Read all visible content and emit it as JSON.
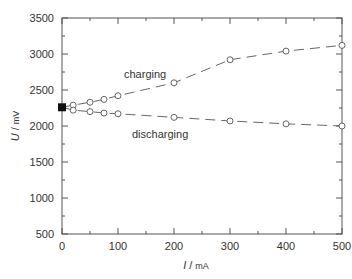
{
  "chart_data": {
    "type": "line",
    "title": "",
    "xlabel": "I / mA",
    "ylabel": "U / mV",
    "xlim": [
      0,
      500
    ],
    "ylim": [
      500,
      3500
    ],
    "xticks": [
      0,
      100,
      200,
      300,
      400,
      500
    ],
    "yticks": [
      500,
      1000,
      1500,
      2000,
      2500,
      3000,
      3500
    ],
    "grid": false,
    "legend": "inline annotations",
    "series": [
      {
        "name": "charging",
        "x": [
          0,
          20,
          50,
          75,
          100,
          200,
          300,
          400,
          500
        ],
        "values": [
          2260,
          2290,
          2330,
          2370,
          2420,
          2600,
          2920,
          3040,
          3120
        ]
      },
      {
        "name": "discharging",
        "x": [
          0,
          20,
          50,
          75,
          100,
          200,
          300,
          400,
          500
        ],
        "values": [
          2260,
          2220,
          2200,
          2180,
          2170,
          2120,
          2070,
          2030,
          2000
        ]
      }
    ],
    "annotations": [
      {
        "text": "charging",
        "x": 150,
        "y": 2750
      },
      {
        "text": "discharging",
        "x": 155,
        "y": 1950
      }
    ],
    "open_circuit_point": {
      "x": 0,
      "y": 2260,
      "marker": "filled"
    }
  },
  "labels": {
    "xlabel_var": "I",
    "xlabel_unit": "mA",
    "ylabel_var": "U",
    "ylabel_unit": "mV",
    "charging": "charging",
    "discharging": "discharging"
  }
}
